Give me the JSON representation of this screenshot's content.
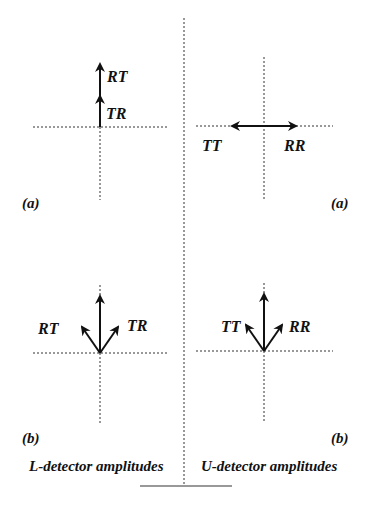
{
  "figure": {
    "colors": {
      "ink": "#111111",
      "axis": "#333333",
      "background": "#ffffff"
    },
    "left_column": {
      "caption": "L-detector amplitudes",
      "panel_a": {
        "label": "(a)",
        "vectors": [
          "TR",
          "RT"
        ],
        "arrangement": "collinear upward, TR then RT stacked"
      },
      "panel_b": {
        "label": "(b)",
        "vectors": [
          "RT",
          "TR"
        ],
        "arrangement": "RT tilted up-left, TR tilted up-right, resultant vertical"
      }
    },
    "right_column": {
      "caption": "U-detector amplitudes",
      "panel_a": {
        "label": "(a)",
        "vectors": [
          "TT",
          "RR"
        ],
        "arrangement": "opposite horizontal, TT left, RR right"
      },
      "panel_b": {
        "label": "(b)",
        "vectors": [
          "TT",
          "RR"
        ],
        "arrangement": "TT tilted up-left, RR tilted up-right, resultant vertical"
      }
    }
  }
}
